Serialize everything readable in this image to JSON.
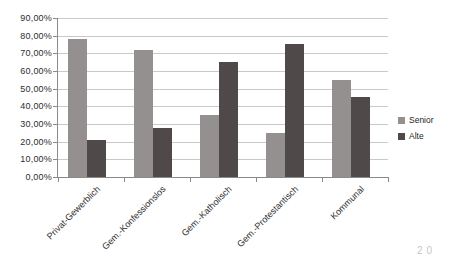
{
  "chart_data": {
    "type": "bar",
    "title": "",
    "xlabel": "",
    "ylabel": "",
    "categories": [
      "Privat-Gewerblich",
      "Gem.-Konfessionslos",
      "Gem.-Katholisch",
      "Gem.-Protestantisch",
      "Kommunal"
    ],
    "series": [
      {
        "name": "Senior",
        "color": "#94908f",
        "values": [
          78,
          72,
          35,
          25,
          55
        ]
      },
      {
        "name": "Alte",
        "color": "#4f4a49",
        "values": [
          21,
          28,
          65,
          75,
          45
        ]
      }
    ],
    "ylim": [
      0,
      90
    ],
    "y_tick_labels": [
      "0,00%",
      "10,00%",
      "20,00%",
      "30,00%",
      "40,00%",
      "50,00%",
      "60,00%",
      "70,00%",
      "80,00%",
      "90,00%"
    ],
    "grid": true,
    "legend_position": "right"
  },
  "legend": {
    "items": [
      {
        "label": "Senior",
        "color": "#94908f"
      },
      {
        "label": "Alte",
        "color": "#4f4a49"
      }
    ]
  },
  "footer": {
    "page_artifact": "20"
  },
  "colors": {
    "gridline": "#c9c9c9",
    "axis": "#8a8a8a",
    "text": "#2e2e2e",
    "background": "#ffffff"
  }
}
